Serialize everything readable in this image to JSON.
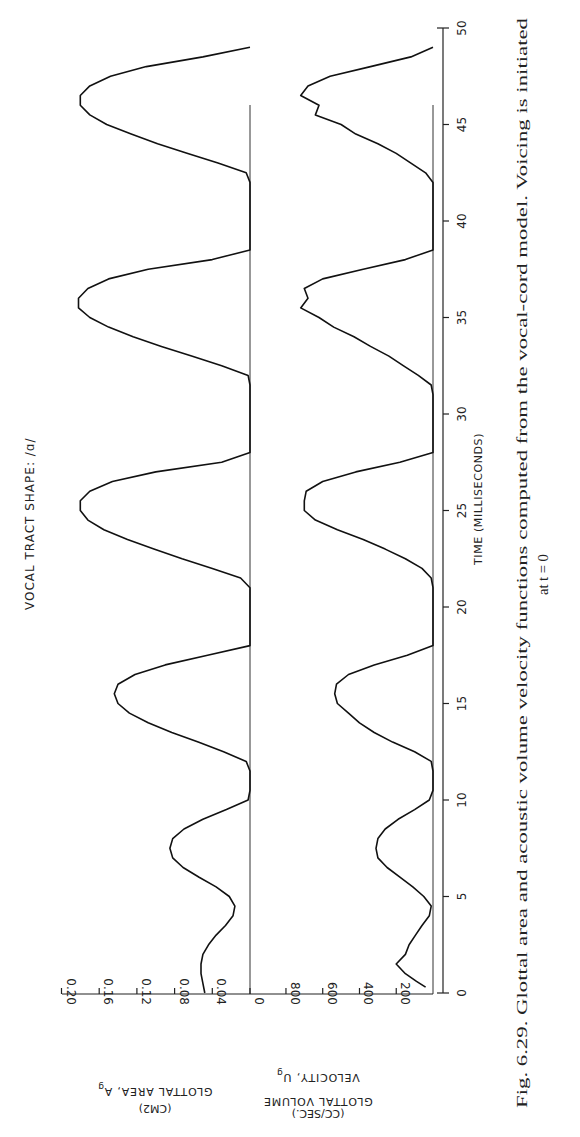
{
  "figure": {
    "title": "VOCAL TRACT SHAPE: /ɑ/",
    "caption_line1": "Fig. 6.29.  Glottal area and acoustic volume velocity functions computed from the vocal-cord model. Voicing is initiated",
    "caption_line2": "at t = 0",
    "time_axis_label": "TIME (MILLISECONDS)",
    "area_axis_label_line1": "GLOTTAL AREA, A",
    "area_axis_label_sub": "g",
    "area_axis_label_line2": "(CM2)",
    "velocity_axis_label_line0": "GLOTTAL VOLUME",
    "velocity_axis_label_line1": "VELOCITY, U",
    "velocity_axis_label_sub": "g",
    "velocity_axis_label_line2": "(CC/SEC.)",
    "orientation": "rotated 90 degrees counter-clockwise on page"
  },
  "chart_data": {
    "type": "line",
    "title": "VOCAL TRACT SHAPE: /ɑ/",
    "xlabel": "TIME (MILLISECONDS)",
    "xlim": [
      0,
      50
    ],
    "x_ticks": [
      0,
      5,
      10,
      15,
      20,
      25,
      30,
      35,
      40,
      45,
      50
    ],
    "grid": false,
    "panels": [
      {
        "name": "Glottal area",
        "ylabel": "GLOTTAL AREA, Ag (CM2)",
        "ylim": [
          0,
          0.2
        ],
        "y_ticks": [
          0,
          0.04,
          0.08,
          0.12,
          0.16,
          0.2
        ],
        "series": [
          {
            "name": "A_g",
            "x": [
              0,
              0.5,
              1,
              1.5,
              2,
              2.5,
              3,
              3.5,
              4,
              4.5,
              5,
              5.5,
              6,
              6.5,
              7,
              7.5,
              8,
              8.5,
              9,
              9.5,
              10,
              10.5,
              11,
              11.5,
              12,
              12.5,
              13,
              13.5,
              14,
              14.5,
              15,
              15.5,
              16,
              16.5,
              17,
              17.5,
              18,
              18.5,
              19,
              19.5,
              20,
              20.5,
              21,
              21.5,
              22,
              22.5,
              23,
              23.5,
              24,
              24.5,
              25,
              25.5,
              26,
              26.5,
              27,
              27.5,
              28,
              28.5,
              29,
              29.5,
              30,
              30.5,
              31,
              31.5,
              32,
              32.5,
              33,
              33.5,
              34,
              34.5,
              35,
              35.5,
              36,
              36.5,
              37,
              37.5,
              38,
              38.5,
              39,
              39.5,
              40,
              40.5,
              41,
              41.5,
              42,
              42.5,
              43,
              43.5,
              44,
              44.5,
              45,
              45.5,
              46,
              46.5,
              47,
              47.5,
              48,
              48.5,
              49
            ],
            "y": [
              0.048,
              0.05,
              0.052,
              0.052,
              0.05,
              0.044,
              0.036,
              0.026,
              0.018,
              0.016,
              0.022,
              0.036,
              0.054,
              0.071,
              0.082,
              0.085,
              0.082,
              0.07,
              0.05,
              0.025,
              0.002,
              0.0,
              0.0,
              0.0,
              0.004,
              0.028,
              0.055,
              0.083,
              0.108,
              0.128,
              0.14,
              0.144,
              0.14,
              0.122,
              0.09,
              0.045,
              0.0,
              0.0,
              0.0,
              0.0,
              0.0,
              0.0,
              0.0,
              0.01,
              0.04,
              0.072,
              0.102,
              0.13,
              0.155,
              0.172,
              0.18,
              0.18,
              0.17,
              0.146,
              0.1,
              0.03,
              0.0,
              0.0,
              0.0,
              0.0,
              0.0,
              0.0,
              0.0,
              0.0,
              0.002,
              0.03,
              0.062,
              0.094,
              0.124,
              0.15,
              0.17,
              0.182,
              0.182,
              0.172,
              0.15,
              0.108,
              0.04,
              0.0,
              0.0,
              0.0,
              0.0,
              0.0,
              0.0,
              0.0,
              0.0,
              0.004,
              0.034,
              0.066,
              0.098,
              0.126,
              0.152,
              0.17,
              0.18,
              0.18,
              0.17,
              0.148,
              0.11,
              0.05,
              0.0
            ]
          }
        ]
      },
      {
        "name": "Glottal volume velocity",
        "ylabel": "GLOTTAL VOLUME VELOCITY, Ug (CC/SEC.)",
        "ylim": [
          0,
          800
        ],
        "y_ticks": [
          200,
          400,
          600,
          800
        ],
        "series": [
          {
            "name": "U_g",
            "x": [
              0.3,
              0.6,
              1,
              1.5,
              2,
              2.5,
              3,
              3.5,
              4,
              4.5,
              5,
              5.5,
              6,
              6.5,
              7,
              7.5,
              8,
              8.5,
              9,
              9.5,
              10,
              10.5,
              11,
              11.5,
              12,
              12.5,
              13,
              13.5,
              14,
              14.5,
              15,
              15.5,
              16,
              16.5,
              17,
              17.5,
              18,
              18.5,
              19,
              19.5,
              20,
              20.5,
              21,
              21.5,
              22,
              22.5,
              23,
              23.5,
              24,
              24.5,
              25,
              25.5,
              26,
              26.5,
              27,
              27.5,
              28,
              28.5,
              29,
              29.5,
              30,
              30.5,
              31,
              31.5,
              32,
              32.5,
              33,
              33.5,
              34,
              34.5,
              35,
              35.5,
              36,
              36.5,
              37,
              37.5,
              38,
              38.5,
              39,
              39.5,
              40,
              40.5,
              41,
              41.5,
              42,
              42.5,
              43,
              43.5,
              44,
              44.5,
              45,
              45.5,
              46,
              46.5,
              47,
              47.5,
              48,
              48.5,
              49
            ],
            "y": [
              40,
              90,
              150,
              200,
              150,
              130,
              95,
              60,
              20,
              10,
              50,
              110,
              180,
              250,
              300,
              310,
              300,
              260,
              190,
              100,
              20,
              0,
              0,
              0,
              10,
              100,
              220,
              320,
              400,
              460,
              520,
              535,
              525,
              460,
              320,
              140,
              0,
              0,
              0,
              0,
              0,
              0,
              0,
              10,
              60,
              150,
              260,
              380,
              520,
              640,
              700,
              700,
              690,
              600,
              420,
              180,
              0,
              0,
              0,
              0,
              0,
              0,
              0,
              10,
              80,
              160,
              240,
              340,
              430,
              540,
              620,
              720,
              680,
              700,
              600,
              380,
              150,
              0,
              0,
              0,
              0,
              0,
              0,
              0,
              0,
              40,
              120,
              200,
              300,
              420,
              500,
              640,
              620,
              720,
              680,
              560,
              340,
              120,
              0
            ]
          }
        ]
      }
    ]
  }
}
